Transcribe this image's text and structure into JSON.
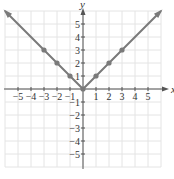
{
  "chart_data": {
    "type": "line",
    "title": "",
    "function": "y = |x|",
    "xlabel": "x",
    "ylabel": "y",
    "xlim": [
      -6,
      6
    ],
    "ylim": [
      -6,
      6
    ],
    "grid": true,
    "legend": null,
    "x_ticks": [
      -5,
      -4,
      -3,
      -2,
      -1,
      1,
      2,
      3,
      4,
      5
    ],
    "y_ticks": [
      -5,
      -4,
      -3,
      -2,
      -1,
      1,
      2,
      3,
      4,
      5
    ],
    "series": [
      {
        "name": "y = |x|",
        "x": [
          -6,
          -3,
          -2,
          -1,
          0,
          1,
          2,
          3,
          6
        ],
        "y": [
          6,
          3,
          2,
          1,
          0,
          1,
          2,
          3,
          6
        ],
        "marked_points": [
          [
            -3,
            3
          ],
          [
            -2,
            2
          ],
          [
            -1,
            1
          ],
          [
            0,
            0
          ],
          [
            1,
            1
          ],
          [
            2,
            2
          ],
          [
            3,
            3
          ]
        ],
        "arrows_at_ends": true,
        "color": "#7a7a7a"
      }
    ]
  },
  "style": {
    "grid_color": "#e4e4e4",
    "axis_color": "#555555",
    "curve_color": "#7a7a7a",
    "text_color": "#333333"
  },
  "layout": {
    "origin_px": [
      83,
      89
    ],
    "unit_px": 13,
    "grid_extent": [
      -6,
      6
    ]
  }
}
